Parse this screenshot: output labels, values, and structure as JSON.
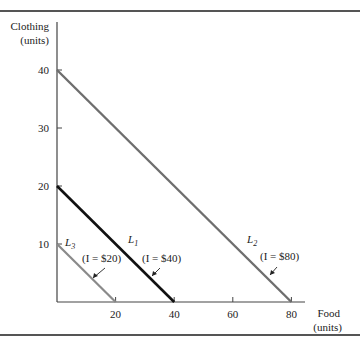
{
  "chart_data": {
    "type": "line",
    "title": "",
    "xlabel": "Food (units)",
    "ylabel": "Clothing (units)",
    "xlabel_lines": [
      "Food",
      "(units)"
    ],
    "ylabel_lines": [
      "Clothing",
      "(units)"
    ],
    "xlim": [
      0,
      90
    ],
    "ylim": [
      0,
      45
    ],
    "x_ticks": [
      20,
      40,
      60,
      80
    ],
    "y_ticks": [
      10,
      20,
      30,
      40
    ],
    "grid": false,
    "series": [
      {
        "name": "L3",
        "label": "L",
        "sub": "3",
        "income": "(I = $20)",
        "points": [
          [
            0,
            10
          ],
          [
            20,
            0
          ]
        ],
        "color": "#8a8a8a",
        "width": 2.2
      },
      {
        "name": "L1",
        "label": "L",
        "sub": "1",
        "income": "(I = $40)",
        "points": [
          [
            0,
            20
          ],
          [
            40,
            0
          ]
        ],
        "color": "#111111",
        "width": 2.6
      },
      {
        "name": "L2",
        "label": "L",
        "sub": "2",
        "income": "(I = $80)",
        "points": [
          [
            0,
            40
          ],
          [
            80,
            0
          ]
        ],
        "color": "#6e6e6e",
        "width": 2.4
      }
    ]
  }
}
